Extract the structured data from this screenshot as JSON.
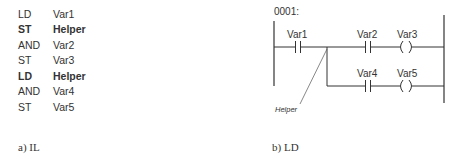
{
  "il": {
    "rows": [
      {
        "op": "LD",
        "arg": "Var1",
        "bold": false
      },
      {
        "op": "ST",
        "arg": "Helper",
        "bold": true
      },
      {
        "op": "AND",
        "arg": "Var2",
        "bold": false
      },
      {
        "op": "ST",
        "arg": "Var3",
        "bold": false
      },
      {
        "op": "LD",
        "arg": "Helper",
        "bold": true
      },
      {
        "op": "AND",
        "arg": "Var4",
        "bold": false
      },
      {
        "op": "ST",
        "arg": "Var5",
        "bold": false
      }
    ],
    "caption": "a) IL"
  },
  "ld": {
    "network_label": "0001:",
    "contacts": [
      "Var1",
      "Var2",
      "Var4"
    ],
    "coils": [
      "Var3",
      "Var5"
    ],
    "helper_label": "Helper",
    "caption": "b) LD"
  }
}
